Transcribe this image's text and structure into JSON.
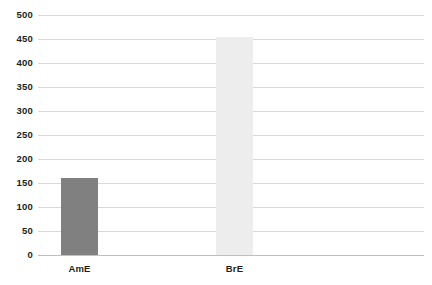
{
  "chart_data": {
    "type": "bar",
    "title": "",
    "subtitle": "",
    "xlabel": "",
    "ylabel": "",
    "categories": [
      "AmE",
      "BrE"
    ],
    "values": [
      160,
      455
    ],
    "series": [
      {
        "name": "frequency",
        "values": [
          160,
          455
        ]
      }
    ],
    "ylim": [
      0,
      500
    ],
    "yticks": [
      0,
      50,
      100,
      150,
      200,
      250,
      300,
      350,
      400,
      450,
      500
    ],
    "ytick_labels": [
      "0",
      "50",
      "100",
      "150",
      "200",
      "250",
      "300",
      "350",
      "400",
      "450",
      "500"
    ],
    "grid": true,
    "grid_axis": "y",
    "legend": false,
    "legend_position": "none",
    "bar_colors": [
      "#808080",
      "#ededed"
    ],
    "bar_width_px": 37,
    "annotations": []
  },
  "style": {
    "background": "#ffffff",
    "gridline_color": "#d9d9d9",
    "baseline_color": "#bfbfbf",
    "text_color": "#231f20"
  }
}
